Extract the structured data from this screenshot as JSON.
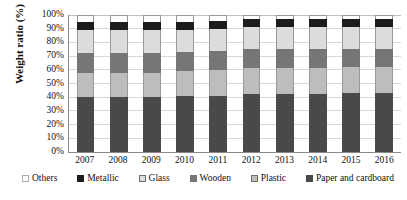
{
  "chart_data": {
    "type": "bar",
    "subtype": "stacked-percentage",
    "title": "",
    "xlabel": "",
    "ylabel": "Weight ratio (%)",
    "ylim": [
      0,
      100
    ],
    "yticks": [
      "0%",
      "10%",
      "20%",
      "30%",
      "40%",
      "50%",
      "60%",
      "70%",
      "80%",
      "90%",
      "100%"
    ],
    "grid": true,
    "legend_position": "bottom",
    "categories": [
      "2007",
      "2008",
      "2009",
      "2010",
      "2011",
      "2012",
      "2013",
      "2014",
      "2015",
      "2016"
    ],
    "stack_order_bottom_to_top": [
      "Paper and cardboard",
      "Plastic",
      "Wooden",
      "Glass",
      "Metallic",
      "Others"
    ],
    "series": [
      {
        "name": "Paper and cardboard",
        "color": "#494949",
        "values": [
          40,
          40,
          40,
          41,
          41,
          42,
          42,
          42,
          43,
          43
        ]
      },
      {
        "name": "Plastic",
        "color": "#bdbdbd",
        "values": [
          18,
          18,
          18,
          18,
          19,
          19,
          19,
          19,
          19,
          19
        ]
      },
      {
        "name": "Wooden",
        "color": "#767676",
        "values": [
          14,
          14,
          14,
          14,
          14,
          14,
          14,
          14,
          13,
          13
        ]
      },
      {
        "name": "Glass",
        "color": "#dcdcdc",
        "values": [
          17,
          17,
          17,
          16,
          16,
          16,
          16,
          16,
          16,
          16
        ]
      },
      {
        "name": "Metallic",
        "color": "#1c1c1c",
        "values": [
          6,
          6,
          6,
          6,
          6,
          6,
          6,
          6,
          6,
          6
        ]
      },
      {
        "name": "Others",
        "color": "#ffffff",
        "values": [
          5,
          5,
          5,
          5,
          4,
          3,
          3,
          3,
          3,
          3
        ]
      }
    ]
  },
  "legend": {
    "items": [
      {
        "label": "Others",
        "swatch": "sw-others"
      },
      {
        "label": "Metallic",
        "swatch": "sw-metallic"
      },
      {
        "label": "Glass",
        "swatch": "sw-glass"
      },
      {
        "label": "Wooden",
        "swatch": "sw-wooden"
      },
      {
        "label": "Plastic",
        "swatch": "sw-plastic"
      },
      {
        "label": "Paper and cardboard",
        "swatch": "sw-paper"
      }
    ]
  }
}
